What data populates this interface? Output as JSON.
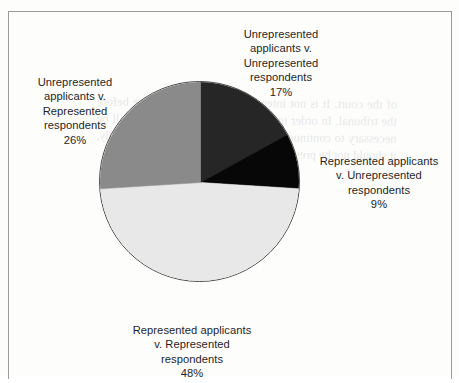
{
  "figure": {
    "frame_color": "#9a9a9a",
    "background_color": "#fdfdfc",
    "bleed_through_text": "of the court. It is not intended that such appearance before the tribunal. In order to limit the use of a lawyer, it will be necessary to continue the test of a new application. Finally, it should not be presumed that the committee."
  },
  "chart_data": {
    "type": "pie",
    "title": "",
    "subtitle": "",
    "xlabel": "",
    "ylabel": "",
    "legend_position": "outside-labels",
    "grid": false,
    "start_angle_deg": 0,
    "direction": "clockwise",
    "categories": [
      "Unrepresented applicants v. Unrepresented respondents",
      "Represented applicants v. Unrepresented respondents",
      "Represented applicants v. Represented respondents",
      "Unrepresented applicants v. Represented respondents"
    ],
    "values": [
      17,
      9,
      48,
      26
    ],
    "value_unit": "%",
    "colors": [
      "#262626",
      "#070707",
      "#e8e8e8",
      "#8a8a8a"
    ],
    "slices": [
      {
        "name": "Unrepresented applicants v. Unrepresented respondents",
        "label": "Unrepresented\napplicants v.\nUnrepresented\nrespondents",
        "value": 17,
        "percent_label": "17%",
        "color": "#262626",
        "start_deg": 0,
        "end_deg": 61.2
      },
      {
        "name": "Represented applicants v. Unrepresented respondents",
        "label": "Represented applicants\nv. Unrepresented\nrespondents",
        "value": 9,
        "percent_label": "9%",
        "color": "#070707",
        "start_deg": 61.2,
        "end_deg": 93.6
      },
      {
        "name": "Represented applicants v. Represented respondents",
        "label": "Represented applicants\nv. Represented\nrespondents",
        "value": 48,
        "percent_label": "48%",
        "color": "#e8e8e8",
        "start_deg": 93.6,
        "end_deg": 266.4
      },
      {
        "name": "Unrepresented applicants v. Represented respondents",
        "label": "Unrepresented\napplicants v.\nRepresented\nrespondents",
        "value": 26,
        "percent_label": "26%",
        "color": "#8a8a8a",
        "start_deg": 266.4,
        "end_deg": 360
      }
    ]
  }
}
